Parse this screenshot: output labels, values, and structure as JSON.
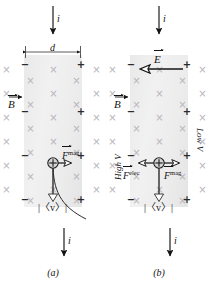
{
  "figure": {
    "type": "hall-effect-diagram",
    "panels": [
      {
        "id": "a",
        "caption": "(a)",
        "current_top_label": "i",
        "current_bottom_label": "i",
        "width_label": "d",
        "bfield_label": "B",
        "carrier_symbol": "+",
        "velocity_label": "|〈v〉|",
        "forces": [
          {
            "name": "magnetic",
            "symbol": "F",
            "superscript": "mag",
            "direction": "right"
          }
        ],
        "edge_signs_left": [
          "−",
          "−",
          "−",
          "−"
        ],
        "edge_signs_right": [
          "+",
          "+",
          "+",
          "+"
        ],
        "has_efield": false,
        "has_voltage_labels": false,
        "has_curved_trajectory": true
      },
      {
        "id": "b",
        "caption": "(b)",
        "current_top_label": "i",
        "current_bottom_label": "i",
        "efield_label": "E",
        "bfield_label": "B",
        "carrier_symbol": "+",
        "velocity_label": "|〈v〉|",
        "forces": [
          {
            "name": "electric",
            "symbol": "F",
            "superscript": "elec",
            "direction": "left"
          },
          {
            "name": "magnetic",
            "symbol": "F",
            "superscript": "mag",
            "direction": "right"
          }
        ],
        "edge_signs_left": [
          "−",
          "−",
          "−"
        ],
        "edge_signs_right": [
          "+",
          "+",
          "+"
        ],
        "voltage_left_label": "High V",
        "voltage_right_label": "Low V",
        "has_efield": true,
        "has_voltage_labels": true,
        "has_curved_trajectory": false
      }
    ],
    "field_marker": "×",
    "colors": {
      "slab": "#ececec",
      "cross_marker": "#b9b3bd",
      "ink": "#141414",
      "background": "#ffffff"
    }
  }
}
